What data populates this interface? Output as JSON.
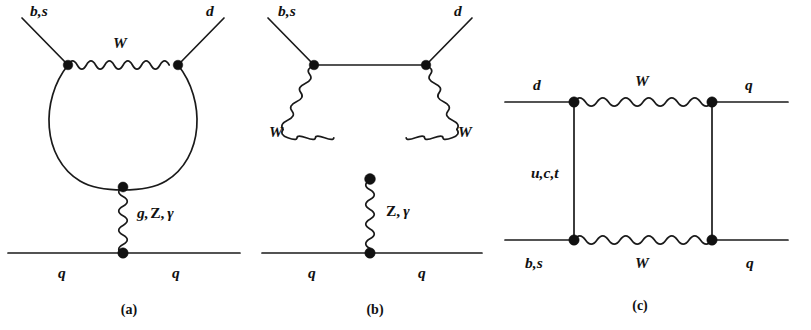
{
  "figure": {
    "background_color": "#ffffff",
    "line_color": "#1a1a1a",
    "vertex_color": "#111111"
  },
  "panels": [
    {
      "id": "a",
      "caption": "(a)",
      "type": "penguin-loop",
      "labels": {
        "in_fermion": "b,s",
        "out_fermion": "d",
        "loop_boson": "W",
        "exchanged_boson": "g,Z, γ",
        "exchanged_boson_parts": [
          "g,",
          "Z,",
          "γ"
        ],
        "spectator_left": "q",
        "spectator_right": "q"
      }
    },
    {
      "id": "b",
      "caption": "(b)",
      "type": "triple-boson-vertex",
      "labels": {
        "in_fermion": "b,s",
        "out_fermion": "d",
        "boson_left": "W",
        "boson_right": "W",
        "exchanged_boson": "Z, γ",
        "exchanged_boson_parts": [
          "Z,",
          "γ"
        ],
        "spectator_left": "q",
        "spectator_right": "q"
      }
    },
    {
      "id": "c",
      "caption": "(c)",
      "type": "box",
      "labels": {
        "in_fermion_top": "d",
        "out_fermion_top": "q",
        "in_fermion_bottom": "b,s",
        "out_fermion_bottom": "q",
        "boson_top": "W",
        "boson_bottom": "W",
        "internal_quark": "u,c,t"
      }
    }
  ]
}
